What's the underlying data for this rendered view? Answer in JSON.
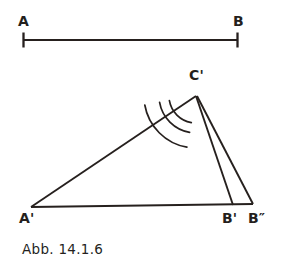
{
  "figure": {
    "caption": "Abb. 14.1.6",
    "ink_color": "#26201e",
    "background_color": "#ffffff",
    "width": 285,
    "height": 272
  },
  "segment": {
    "name": "reference-segment",
    "label_left": "A",
    "label_right": "B",
    "left_x": 23,
    "right_x": 238,
    "y": 40,
    "tick_half_height": 7
  },
  "triangle": {
    "name": "constructed-triangle",
    "vertices": [
      {
        "id": "A-prime",
        "label": "A'",
        "x": 31,
        "y": 207
      },
      {
        "id": "B-prime",
        "label": "B'",
        "x": 233,
        "y": 205
      },
      {
        "id": "C-prime",
        "label": "C'",
        "x": 196,
        "y": 96
      }
    ],
    "extra_point": {
      "id": "B-double-prime",
      "label": "B″",
      "x": 253,
      "y": 204
    }
  },
  "arcs": {
    "name": "angle-arcs-at-C-prime",
    "center": {
      "x": 196,
      "y": 96
    },
    "radii": [
      27,
      37,
      52
    ],
    "start_angle_deg": 100,
    "end_angle_deg": 170
  },
  "labels": {
    "A": "A",
    "B": "B",
    "A_prime": "A'",
    "B_prime": "B'",
    "B_double_prime": "B″",
    "C_prime": "C'"
  }
}
